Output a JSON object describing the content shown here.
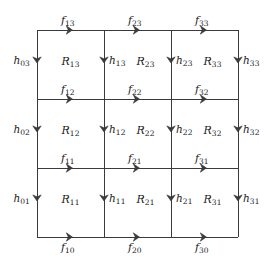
{
  "figure": {
    "kind": "grid-flow-diagram",
    "title": "",
    "line_color": "#3a3a3a",
    "text_color": "#222222",
    "background": "#ffffff",
    "grid": {
      "columns": 3,
      "rows": 3,
      "x_positions": [
        37,
        104,
        171,
        238
      ],
      "y_positions": [
        30,
        99,
        168,
        237
      ]
    }
  },
  "horizontal_flows": [
    {
      "label": "f",
      "sub": "13",
      "col": 0,
      "line": 0,
      "label_below": false
    },
    {
      "label": "f",
      "sub": "23",
      "col": 1,
      "line": 0,
      "label_below": false
    },
    {
      "label": "f",
      "sub": "33",
      "col": 2,
      "line": 0,
      "label_below": false
    },
    {
      "label": "f",
      "sub": "12",
      "col": 0,
      "line": 1,
      "label_below": false
    },
    {
      "label": "f",
      "sub": "22",
      "col": 1,
      "line": 1,
      "label_below": false
    },
    {
      "label": "f",
      "sub": "32",
      "col": 2,
      "line": 1,
      "label_below": false
    },
    {
      "label": "f",
      "sub": "11",
      "col": 0,
      "line": 2,
      "label_below": false
    },
    {
      "label": "f",
      "sub": "21",
      "col": 1,
      "line": 2,
      "label_below": false
    },
    {
      "label": "f",
      "sub": "31",
      "col": 2,
      "line": 2,
      "label_below": false
    },
    {
      "label": "f",
      "sub": "10",
      "col": 0,
      "line": 3,
      "label_below": true
    },
    {
      "label": "f",
      "sub": "20",
      "col": 1,
      "line": 3,
      "label_below": true
    },
    {
      "label": "f",
      "sub": "30",
      "col": 2,
      "line": 3,
      "label_below": true
    }
  ],
  "vertical_flows": [
    {
      "label": "h",
      "sub": "03",
      "line": 0,
      "row": 0,
      "label_side": "left"
    },
    {
      "label": "h",
      "sub": "13",
      "line": 1,
      "row": 0,
      "label_side": "right"
    },
    {
      "label": "h",
      "sub": "23",
      "line": 2,
      "row": 0,
      "label_side": "right"
    },
    {
      "label": "h",
      "sub": "33",
      "line": 3,
      "row": 0,
      "label_side": "right"
    },
    {
      "label": "h",
      "sub": "02",
      "line": 0,
      "row": 1,
      "label_side": "left"
    },
    {
      "label": "h",
      "sub": "12",
      "line": 1,
      "row": 1,
      "label_side": "right"
    },
    {
      "label": "h",
      "sub": "22",
      "line": 2,
      "row": 1,
      "label_side": "right"
    },
    {
      "label": "h",
      "sub": "32",
      "line": 3,
      "row": 1,
      "label_side": "right"
    },
    {
      "label": "h",
      "sub": "01",
      "line": 0,
      "row": 2,
      "label_side": "left"
    },
    {
      "label": "h",
      "sub": "11",
      "line": 1,
      "row": 2,
      "label_side": "right"
    },
    {
      "label": "h",
      "sub": "21",
      "line": 2,
      "row": 2,
      "label_side": "right"
    },
    {
      "label": "h",
      "sub": "31",
      "line": 3,
      "row": 2,
      "label_side": "right"
    }
  ],
  "cells": [
    {
      "label": "R",
      "sub": "13",
      "col": 0,
      "row": 0
    },
    {
      "label": "R",
      "sub": "23",
      "col": 1,
      "row": 0
    },
    {
      "label": "R",
      "sub": "33",
      "col": 2,
      "row": 0
    },
    {
      "label": "R",
      "sub": "12",
      "col": 0,
      "row": 1
    },
    {
      "label": "R",
      "sub": "22",
      "col": 1,
      "row": 1
    },
    {
      "label": "R",
      "sub": "32",
      "col": 2,
      "row": 1
    },
    {
      "label": "R",
      "sub": "11",
      "col": 0,
      "row": 2
    },
    {
      "label": "R",
      "sub": "21",
      "col": 1,
      "row": 2
    },
    {
      "label": "R",
      "sub": "31",
      "col": 2,
      "row": 2
    }
  ]
}
